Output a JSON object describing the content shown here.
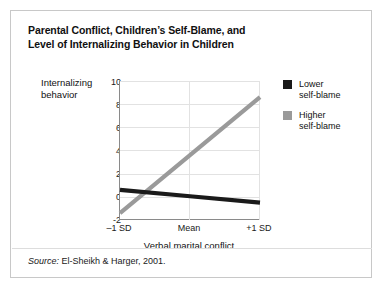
{
  "figure": {
    "title_line1": "Parental Conflict, Children’s Self-Blame, and",
    "title_line2": "Level of Internalizing Behavior in Children",
    "source_word": "Source:",
    "source_text": " El-Sheikh & Harger, 2001."
  },
  "legend": {
    "items": [
      {
        "label_line1": "Lower",
        "label_line2": "self-blame",
        "color": "#1a1a1a"
      },
      {
        "label_line1": "Higher",
        "label_line2": "self-blame",
        "color": "#9a9a9a"
      }
    ]
  },
  "axis": {
    "ylabel_line1": "Internalizing",
    "ylabel_line2": "behavior",
    "xlabel": "Verbal marital conflict",
    "yticks": [
      "10",
      "8",
      "6",
      "4",
      "2",
      "0",
      "-2"
    ],
    "xticks": [
      "–1 SD",
      "Mean",
      "+1 SD"
    ]
  },
  "chart_data": {
    "type": "line",
    "title": "Parental Conflict, Children’s Self-Blame, and Level of Internalizing Behavior in Children",
    "xlabel": "Verbal marital conflict",
    "ylabel": "Internalizing behavior",
    "categories": [
      "–1 SD",
      "Mean",
      "+1 SD"
    ],
    "x": [
      -1,
      0,
      1
    ],
    "ylim": [
      -2,
      10
    ],
    "xlim": [
      -1,
      1
    ],
    "yticks": [
      -2,
      0,
      2,
      4,
      6,
      8,
      10
    ],
    "grid": true,
    "legend_position": "right",
    "series": [
      {
        "name": "Lower self-blame",
        "color": "#1a1a1a",
        "values": [
          0.6,
          0.05,
          -0.5
        ]
      },
      {
        "name": "Higher self-blame",
        "color": "#9a9a9a",
        "values": [
          -1.4,
          3.6,
          8.6
        ]
      }
    ],
    "annotations": [
      "Source: El-Sheikh & Harger, 2001."
    ]
  }
}
